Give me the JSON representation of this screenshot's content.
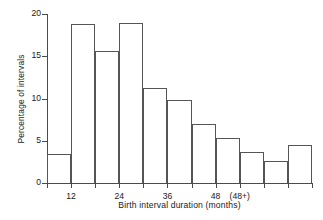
{
  "chart_data": {
    "type": "bar",
    "title": "",
    "subtitle": "",
    "xlabel": "Birth interval duration (months)",
    "ylabel": "Percentage of intervals",
    "xlim": [
      6,
      72
    ],
    "ylim": [
      0,
      20
    ],
    "grid": false,
    "legend": null,
    "bin_width_months": 6,
    "x_tick_values": [
      6,
      12,
      18,
      24,
      30,
      36,
      42,
      48,
      54,
      60,
      66,
      72
    ],
    "x_tick_labels": [
      "",
      "12",
      "",
      "24",
      "",
      "36",
      "",
      "48",
      "(48+)",
      "",
      "",
      ""
    ],
    "y_tick_values": [
      0,
      5,
      10,
      15,
      20
    ],
    "y_tick_labels": [
      "0",
      "5",
      "10",
      "15",
      "20"
    ],
    "categories": [
      "6-12",
      "12-18",
      "18-24",
      "24-30",
      "30-36",
      "36-42",
      "42-48",
      "48-54",
      "54-60",
      "60-66",
      "48+"
    ],
    "bin_starts": [
      6,
      12,
      18,
      24,
      30,
      36,
      42,
      48,
      54,
      60,
      66
    ],
    "bin_ends": [
      12,
      18,
      24,
      30,
      36,
      42,
      48,
      54,
      60,
      66,
      72
    ],
    "values": [
      3.4,
      18.8,
      15.6,
      18.9,
      11.3,
      9.8,
      7.0,
      5.3,
      3.7,
      2.6,
      4.5
    ],
    "bar_fill_color": "#ffffff",
    "bar_edge_color": "#555555",
    "axis_color": "#4a4a4a",
    "background_color": "#ffffff"
  }
}
